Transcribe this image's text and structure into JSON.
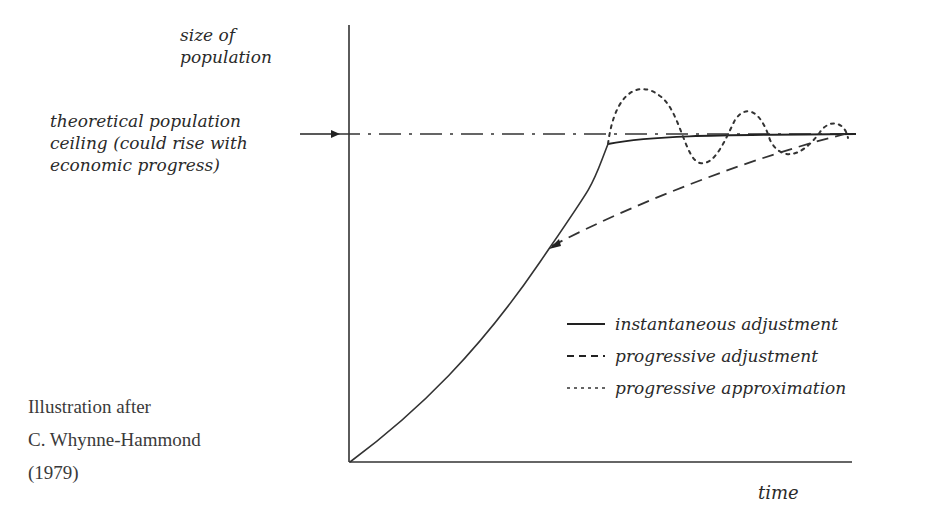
{
  "diagram": {
    "type": "line-sketch",
    "y_axis_label_line1": "size of",
    "y_axis_label_line2": "population",
    "x_axis_label": "time",
    "ceiling_label": {
      "line1": "theoretical population",
      "line2": "ceiling (could rise with",
      "line3": "economic progress)"
    },
    "legend": [
      {
        "style": "solid",
        "label": "instantaneous adjustment"
      },
      {
        "style": "dashed",
        "label": "progressive adjustment"
      },
      {
        "style": "dotted",
        "label": "progressive approximation"
      }
    ],
    "credit": {
      "line1": "Illustration after",
      "line2": "C. Whynne-Hammond",
      "line3": "(1979)"
    },
    "colors": {
      "ink": "#2a2a2a",
      "background": "#ffffff"
    }
  }
}
